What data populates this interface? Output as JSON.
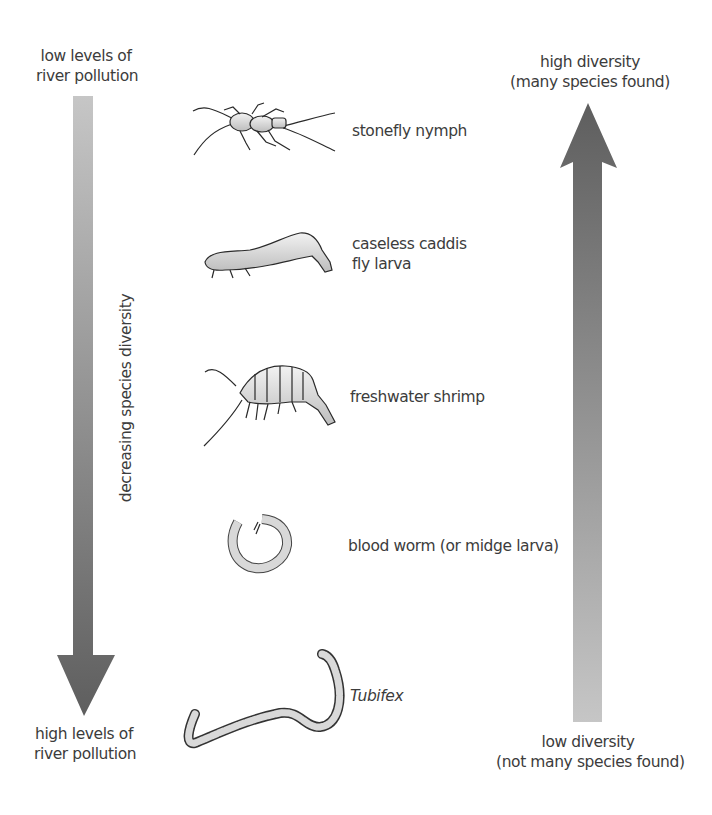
{
  "left_scale": {
    "top_label_line1": "low levels of",
    "top_label_line2": "river pollution",
    "bottom_label_line1": "high levels of",
    "bottom_label_line2": "river pollution",
    "axis_label": "decreasing species diversity",
    "arrow_direction": "down",
    "gradient": {
      "start": "#c4c4c4",
      "end": "#616161"
    }
  },
  "right_scale": {
    "top_label_line1": "high diversity",
    "top_label_line2": "(many species found)",
    "bottom_label_line1": "low diversity",
    "bottom_label_line2": "(not many species found)",
    "arrow_direction": "up",
    "gradient": {
      "start": "#c4c4c4",
      "end": "#616161"
    }
  },
  "organisms": [
    {
      "name": "stonefly nymph",
      "icon": "stonefly-nymph-illustration"
    },
    {
      "name_line1": "caseless caddis",
      "name_line2": "fly larva",
      "icon": "caddis-larva-illustration"
    },
    {
      "name": "freshwater shrimp",
      "icon": "freshwater-shrimp-illustration"
    },
    {
      "name": "blood worm (or midge larva)",
      "icon": "blood-worm-illustration"
    },
    {
      "name": "Tubifex",
      "icon": "tubifex-worm-illustration"
    }
  ]
}
